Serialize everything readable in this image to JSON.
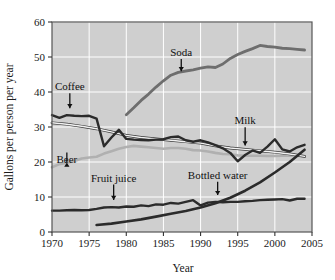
{
  "chart_data": {
    "type": "line",
    "title": "",
    "xlabel": "Year",
    "ylabel": "Gallons per person per year",
    "xlim": [
      1970,
      2005
    ],
    "ylim": [
      0,
      60
    ],
    "xticks": [
      "1970",
      "1975",
      "1980",
      "1985",
      "1990",
      "1995",
      "2000",
      "2005"
    ],
    "yticks": [
      "0",
      "10",
      "20",
      "30",
      "40",
      "50",
      "60"
    ],
    "grid": true,
    "grid_color": "#ffffff",
    "plot_background": "#cfcfcf",
    "legend": "annotations-with-arrows",
    "annotations": [
      {
        "label": "Coffee",
        "x": 1972.4,
        "y": 40.5,
        "arrow_to_y": 34.2
      },
      {
        "label": "Beer",
        "x": 1972.0,
        "y": 19.6,
        "arrow_to_y": 21.0
      },
      {
        "label": "Soda",
        "x": 1987.4,
        "y": 50.3,
        "arrow_to_y": 44.8
      },
      {
        "label": "Fruit juice",
        "x": 1978.3,
        "y": 14.4,
        "arrow_to_y": 8.0
      },
      {
        "label": "Bottled water",
        "x": 1992.3,
        "y": 15.2,
        "arrow_to_y": 9.4
      },
      {
        "label": "Milk",
        "x": 1996.0,
        "y": 30.8,
        "arrow_to_y": 23.6
      }
    ],
    "series": [
      {
        "name": "Coffee",
        "color": "#2b2b2b",
        "width": 2.4,
        "x": [
          1970,
          1971,
          1972,
          1973,
          1974,
          1975,
          1976,
          1977,
          1978,
          1979,
          1980,
          1981,
          1982,
          1983,
          1984,
          1985,
          1986,
          1987,
          1988,
          1989,
          1990,
          1991,
          1992,
          1993,
          1994,
          1995,
          1996,
          1997,
          1998,
          1999,
          2000,
          2001,
          2002,
          2003,
          2004
        ],
        "values": [
          33.4,
          32.6,
          33.4,
          33.2,
          33.1,
          33.2,
          32.4,
          24.5,
          27.0,
          29.2,
          26.6,
          26.4,
          26.3,
          26.2,
          26.4,
          26.5,
          27.1,
          27.3,
          26.2,
          25.8,
          26.2,
          25.6,
          24.8,
          23.9,
          22.6,
          20.2,
          22.0,
          23.3,
          22.6,
          24.4,
          26.5,
          23.6,
          23.0,
          24.2,
          24.9
        ]
      },
      {
        "name": "Milk",
        "color": "#f2f2f2",
        "outline": "#3a3a3a",
        "width": 1.4,
        "x": [
          1970,
          1972,
          1974,
          1976,
          1978,
          1980,
          1982,
          1984,
          1986,
          1988,
          1990,
          1992,
          1994,
          1996,
          1998,
          2000,
          2002,
          2004
        ],
        "values": [
          31.2,
          30.8,
          30.2,
          29.5,
          28.6,
          27.6,
          27.0,
          26.6,
          26.2,
          25.8,
          25.4,
          24.6,
          24.0,
          23.6,
          23.2,
          22.8,
          22.3,
          21.6
        ]
      },
      {
        "name": "Beer",
        "color": "#b0b0b0",
        "width": 2.6,
        "x": [
          1970,
          1971,
          1972,
          1973,
          1974,
          1975,
          1976,
          1977,
          1978,
          1979,
          1980,
          1981,
          1982,
          1983,
          1984,
          1985,
          1986,
          1987,
          1988,
          1989,
          1990,
          1991,
          1992,
          1993,
          1994,
          1995,
          1996,
          1997,
          1998,
          1999,
          2000,
          2001,
          2002,
          2003,
          2004
        ],
        "values": [
          18.5,
          19.4,
          19.8,
          20.3,
          21.0,
          21.3,
          21.5,
          22.4,
          23.1,
          23.8,
          24.3,
          24.6,
          24.4,
          24.2,
          24.0,
          23.8,
          24.0,
          24.0,
          23.8,
          23.4,
          23.3,
          23.0,
          22.6,
          22.3,
          22.2,
          21.9,
          21.8,
          21.8,
          21.8,
          21.7,
          21.7,
          21.8,
          21.9,
          21.8,
          21.6
        ]
      },
      {
        "name": "Soda",
        "color": "#6e6e6e",
        "width": 2.8,
        "x": [
          1980,
          1981,
          1982,
          1983,
          1984,
          1985,
          1986,
          1987,
          1988,
          1989,
          1990,
          1991,
          1992,
          1993,
          1994,
          1995,
          1996,
          1997,
          1998,
          1999,
          2000,
          2001,
          2002,
          2003,
          2004
        ],
        "values": [
          33.5,
          35.5,
          37.6,
          39.4,
          41.4,
          43.2,
          44.8,
          45.6,
          46.0,
          46.3,
          46.8,
          47.2,
          47.0,
          48.0,
          49.6,
          50.7,
          51.6,
          52.4,
          53.3,
          53.0,
          52.8,
          52.5,
          52.4,
          52.2,
          52.0
        ]
      },
      {
        "name": "Fruit juice",
        "color": "#2b2b2b",
        "width": 2.4,
        "x": [
          1970,
          1971,
          1972,
          1973,
          1974,
          1975,
          1976,
          1977,
          1978,
          1979,
          1980,
          1981,
          1982,
          1983,
          1984,
          1985,
          1986,
          1987,
          1988,
          1989,
          1990,
          1991,
          1992,
          1993,
          1994,
          1995,
          1996,
          1997,
          1998,
          1999,
          2000,
          2001,
          2002,
          2003,
          2004
        ],
        "values": [
          6.1,
          6.1,
          6.2,
          6.3,
          6.2,
          6.3,
          6.6,
          7.0,
          7.1,
          7.0,
          7.3,
          7.2,
          7.6,
          7.4,
          7.9,
          7.8,
          8.3,
          8.1,
          8.6,
          9.1,
          7.6,
          8.4,
          8.6,
          8.5,
          8.6,
          8.6,
          8.8,
          8.9,
          9.1,
          9.2,
          9.3,
          9.4,
          9.0,
          9.5,
          9.5
        ]
      },
      {
        "name": "Bottled water",
        "color": "#2b2b2b",
        "width": 2.6,
        "x": [
          1976,
          1978,
          1980,
          1982,
          1984,
          1986,
          1988,
          1990,
          1992,
          1994,
          1996,
          1998,
          2000,
          2002,
          2004
        ],
        "values": [
          2.0,
          2.4,
          3.0,
          3.6,
          4.4,
          5.2,
          6.0,
          7.0,
          8.2,
          9.8,
          11.8,
          14.2,
          17.0,
          20.0,
          23.5
        ]
      }
    ]
  },
  "axes": {
    "x_title": "Year",
    "y_title": "Gallons per person per year"
  }
}
